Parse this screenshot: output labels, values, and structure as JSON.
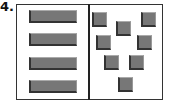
{
  "label": "4.",
  "panels": {
    "left": {
      "arrangement": "vertical stack of horizontal bars",
      "bars": [
        {
          "top": 10
        },
        {
          "top": 33
        },
        {
          "top": 57
        },
        {
          "top": 80
        }
      ]
    },
    "right": {
      "arrangement": "scattered squares",
      "squares": [
        {
          "left": 92,
          "top": 12
        },
        {
          "left": 141,
          "top": 12
        },
        {
          "left": 116,
          "top": 21
        },
        {
          "left": 96,
          "top": 35
        },
        {
          "left": 137,
          "top": 35
        },
        {
          "left": 104,
          "top": 55
        },
        {
          "left": 129,
          "top": 55
        },
        {
          "left": 118,
          "top": 77
        }
      ]
    }
  },
  "colors": {
    "fill": "#777777",
    "shadow": "#333333",
    "frame": "#333333"
  }
}
